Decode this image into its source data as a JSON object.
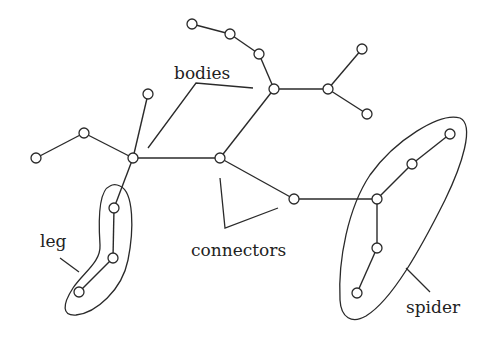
{
  "diagram": {
    "type": "tree-decomposition",
    "labels": {
      "bodies": "bodies",
      "connectors": "connectors",
      "leg": "leg",
      "spider": "spider"
    },
    "nodes": [
      {
        "id": "n1",
        "x": 192,
        "y": 24
      },
      {
        "id": "n2",
        "x": 230,
        "y": 34
      },
      {
        "id": "n3",
        "x": 259,
        "y": 54
      },
      {
        "id": "h3",
        "x": 274,
        "y": 89
      },
      {
        "id": "h4",
        "x": 328,
        "y": 89
      },
      {
        "id": "n4",
        "x": 362,
        "y": 49
      },
      {
        "id": "n5",
        "x": 367,
        "y": 114
      },
      {
        "id": "c1",
        "x": 148,
        "y": 94
      },
      {
        "id": "d1",
        "x": 84,
        "y": 133
      },
      {
        "id": "e1",
        "x": 36,
        "y": 158
      },
      {
        "id": "h1",
        "x": 133,
        "y": 158
      },
      {
        "id": "h2",
        "x": 220,
        "y": 158
      },
      {
        "id": "m1",
        "x": 294,
        "y": 199
      },
      {
        "id": "s0",
        "x": 377,
        "y": 199
      },
      {
        "id": "s1",
        "x": 412,
        "y": 164
      },
      {
        "id": "s2",
        "x": 450,
        "y": 134
      },
      {
        "id": "s3",
        "x": 377,
        "y": 248
      },
      {
        "id": "s4",
        "x": 357,
        "y": 293
      },
      {
        "id": "l1",
        "x": 114,
        "y": 208
      },
      {
        "id": "l2",
        "x": 113,
        "y": 258
      },
      {
        "id": "l3",
        "x": 79,
        "y": 292
      }
    ],
    "edges": [
      [
        "n1",
        "n2"
      ],
      [
        "n2",
        "n3"
      ],
      [
        "n3",
        "h3"
      ],
      [
        "h3",
        "h4"
      ],
      [
        "h4",
        "n4"
      ],
      [
        "h4",
        "n5"
      ],
      [
        "h3",
        "h2"
      ],
      [
        "h2",
        "h1"
      ],
      [
        "h1",
        "c1"
      ],
      [
        "h1",
        "d1"
      ],
      [
        "d1",
        "e1"
      ],
      [
        "h1",
        "l1"
      ],
      [
        "l1",
        "l2"
      ],
      [
        "l2",
        "l3"
      ],
      [
        "h2",
        "m1"
      ],
      [
        "m1",
        "s0"
      ],
      [
        "s0",
        "s1"
      ],
      [
        "s1",
        "s2"
      ],
      [
        "s0",
        "s3"
      ],
      [
        "s3",
        "s4"
      ]
    ],
    "groups": [
      "leg",
      "spider"
    ]
  },
  "colors": {
    "stroke": "#2a2a2a",
    "background": "#ffffff",
    "text": "#222222"
  }
}
